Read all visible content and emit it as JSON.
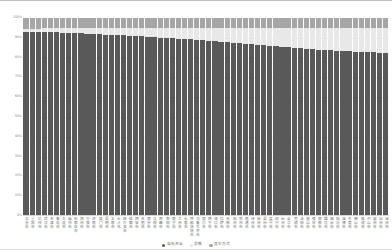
{
  "chart_data": {
    "type": "bar",
    "stacked": true,
    "stacked_normalized": true,
    "title": "",
    "xlabel": "",
    "ylabel": "",
    "ylim": [
      0,
      100
    ],
    "ytick_labels": [
      "100%",
      "90%",
      "80%",
      "70%",
      "60%",
      "50%",
      "40%",
      "30%",
      "20%",
      "10%",
      "0%"
    ],
    "ytick_values": [
      100,
      90,
      80,
      70,
      60,
      50,
      40,
      30,
      20,
      10,
      0
    ],
    "grid": true,
    "legend_position": "bottom",
    "categories": [
      "北京市",
      "重庆市",
      "杭州市",
      "武汉市",
      "天津市",
      "青岛市",
      "大连市",
      "福州市",
      "石家庄市",
      "郑州市",
      "宁波市",
      "济南市",
      "厦门市",
      "昆明市",
      "太原市",
      "长沙市",
      "哈尔滨市",
      "成都市",
      "西安市",
      "合肥市",
      "南京市",
      "沈阳市",
      "南昌市",
      "贵阳市",
      "南宁市",
      "兰州市",
      "长春市",
      "呼和浩特市",
      "乌鲁木齐市",
      "银川市",
      "西宁市",
      "海口市",
      "拉萨市",
      "无锡市",
      "苏州市",
      "常州市",
      "南通市",
      "徐州市",
      "扬州市",
      "温州市",
      "嘉兴市",
      "绍兴市",
      "台州市",
      "金华市",
      "芜湖市",
      "洛阳市",
      "唐山市",
      "保定市",
      "邯郸市",
      "潍坊市",
      "烟台市",
      "临沂市",
      "淄博市",
      "东莞市",
      "佛山市",
      "珠海市",
      "中山市",
      "惠州市",
      "泉州市",
      "漳州市"
    ],
    "series": [
      {
        "name": "自有资金",
        "color": "#595959",
        "values": [
          93.0,
          93.0,
          93.0,
          93.0,
          93.0,
          92.8,
          92.6,
          92.5,
          92.3,
          92.2,
          92.0,
          91.9,
          91.8,
          91.6,
          91.5,
          91.3,
          91.2,
          91.0,
          90.9,
          90.7,
          90.5,
          90.3,
          90.1,
          90.0,
          89.8,
          89.6,
          89.4,
          89.2,
          89.0,
          88.8,
          88.6,
          88.3,
          88.1,
          87.9,
          87.6,
          87.4,
          87.1,
          86.9,
          86.6,
          86.3,
          86.0,
          85.8,
          85.5,
          85.2,
          84.9,
          84.7,
          84.5,
          84.2,
          84.0,
          83.8,
          83.6,
          83.4,
          83.3,
          83.1,
          83.0,
          82.9,
          82.8,
          82.6,
          82.4,
          82.2
        ]
      },
      {
        "name": "贷款",
        "color": "#e8e8e8",
        "values": [
          1.5,
          1.6,
          1.7,
          1.8,
          1.9,
          2.1,
          2.2,
          2.4,
          2.6,
          2.7,
          2.9,
          3.0,
          3.1,
          3.3,
          3.4,
          3.6,
          3.7,
          3.9,
          4.0,
          4.2,
          4.4,
          4.6,
          4.8,
          4.9,
          5.1,
          5.3,
          5.5,
          5.7,
          5.9,
          6.1,
          6.3,
          6.6,
          6.8,
          7.0,
          7.3,
          7.5,
          7.8,
          8.0,
          8.3,
          8.6,
          8.9,
          9.1,
          9.4,
          9.7,
          10.0,
          10.2,
          10.4,
          10.7,
          10.9,
          11.1,
          11.3,
          11.5,
          11.6,
          11.8,
          11.9,
          12.0,
          12.1,
          12.3,
          12.5,
          12.7
        ]
      },
      {
        "name": "其它方式",
        "color": "#a6a6a6",
        "values": [
          5.5,
          5.4,
          5.3,
          5.2,
          5.1,
          5.1,
          5.2,
          5.1,
          5.1,
          5.1,
          5.1,
          5.1,
          5.1,
          5.1,
          5.1,
          5.1,
          5.1,
          5.1,
          5.1,
          5.1,
          5.1,
          5.1,
          5.1,
          5.1,
          5.1,
          5.1,
          5.1,
          5.1,
          5.1,
          5.1,
          5.1,
          5.1,
          5.1,
          5.1,
          5.1,
          5.1,
          5.1,
          5.1,
          5.1,
          5.1,
          5.1,
          5.1,
          5.1,
          5.1,
          5.1,
          5.1,
          5.1,
          5.1,
          5.1,
          5.1,
          5.1,
          5.1,
          5.1,
          5.1,
          5.1,
          5.1,
          5.1,
          5.1,
          5.1,
          5.1
        ]
      }
    ],
    "legend": [
      {
        "label": "自有资金",
        "color": "#595959"
      },
      {
        "label": "贷款",
        "color": "#e8e8e8"
      },
      {
        "label": "其它方式",
        "color": "#a6a6a6"
      }
    ]
  }
}
